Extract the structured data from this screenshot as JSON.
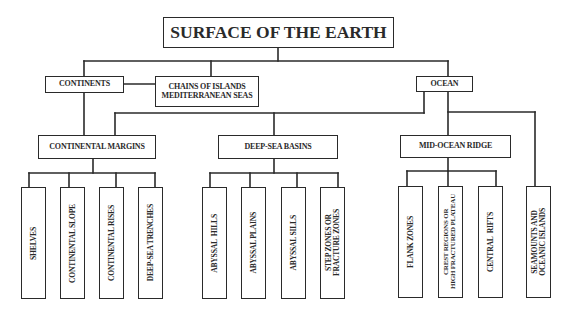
{
  "diagram": {
    "title": "SURFACE OF THE EARTH",
    "level1": {
      "continents": "CONTINENTS",
      "chains_line1": "CHAINS OF ISLANDS",
      "chains_line2": "MEDITERRANEAN SEAS",
      "ocean": "OCEAN"
    },
    "level2": {
      "continental_margins": "CONTINENTAL MARGINS",
      "deep_sea_basins": "DEEP-SEA BASINS",
      "mid_ocean_ridge": "MID-OCEAN RIDGE"
    },
    "leaves": {
      "continental_margins": [
        {
          "line1": "SHELVES"
        },
        {
          "line1": "CONTINENTAL SLOPE"
        },
        {
          "line1": "CONTINENTAL RISES"
        },
        {
          "line1": "DEEP-SEA TRENCHES"
        }
      ],
      "deep_sea_basins": [
        {
          "line1": "ABYSSAL  HILLS"
        },
        {
          "line1": "ABYSSAL PLAINS"
        },
        {
          "line1": "ABYSSAL SILLS"
        },
        {
          "line1": "STEP ZONES OR",
          "line2": "FRACTURE ZONES"
        }
      ],
      "mid_ocean_ridge": [
        {
          "line1": "FLANK ZONES"
        },
        {
          "line1": "CREST REGIONS OR",
          "line2": "HIGH FRACTURED PLATEAU"
        },
        {
          "line1": "CENTRAL  RIFTS"
        }
      ],
      "ocean_direct": [
        {
          "line1": "SEAMOUNTS AND",
          "line2": "OCEANIC ISLANDS"
        }
      ]
    }
  }
}
